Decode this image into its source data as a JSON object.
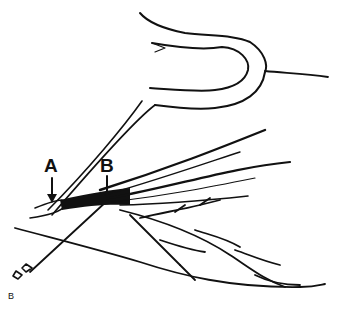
{
  "figure": {
    "labels": {
      "a": "A",
      "b": "B",
      "panel": "B"
    },
    "colors": {
      "ink": "#111111",
      "background": "#ffffff"
    }
  }
}
